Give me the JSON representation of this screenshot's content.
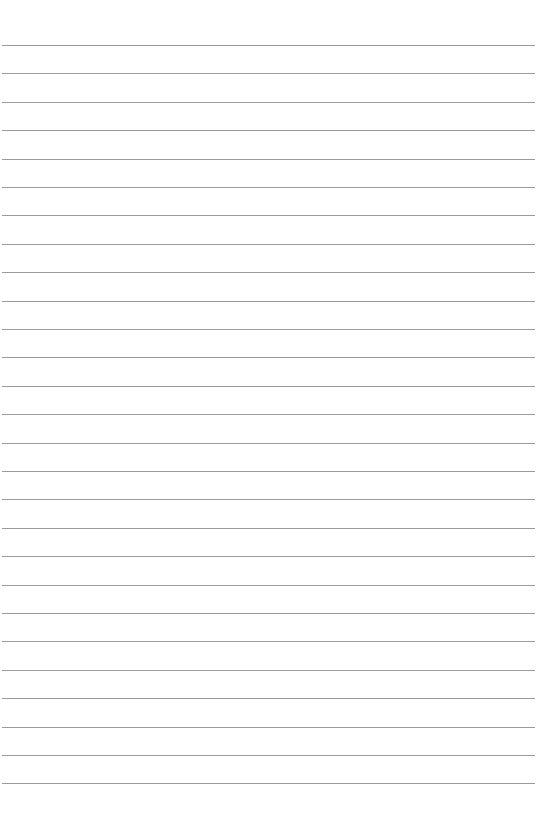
{
  "page": {
    "type": "lined-paper",
    "background_color": "#ffffff",
    "line_color": "#8a8a8a",
    "line_count": 27,
    "first_line_y": 45,
    "line_spacing": 28.4,
    "text": ""
  }
}
